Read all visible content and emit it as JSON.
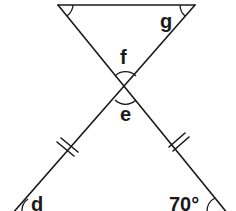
{
  "diagram": {
    "labels": {
      "g": "g",
      "f": "f",
      "e": "e",
      "d": "d",
      "given_angle": "70°"
    },
    "angles": [
      {
        "name": "top-left-angle",
        "label": "",
        "marked": true
      },
      {
        "name": "g",
        "label": "g",
        "marked": true
      },
      {
        "name": "f",
        "label": "f",
        "marked": true
      },
      {
        "name": "e",
        "label": "e",
        "marked": true
      },
      {
        "name": "d",
        "label": "d",
        "marked": true
      },
      {
        "name": "bottom-right-angle",
        "label": "70°",
        "marked": true
      }
    ],
    "equal_sides_marker": "double-tick",
    "colors": {
      "ink": "#1a1a1a",
      "background": "#ffffff"
    }
  }
}
